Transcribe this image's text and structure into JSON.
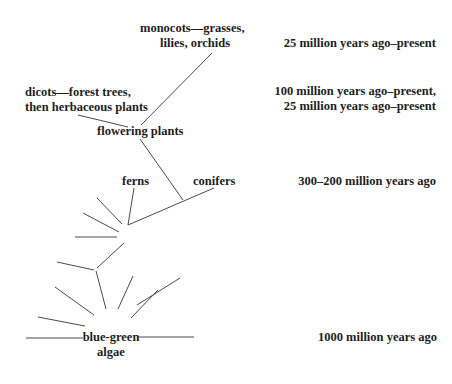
{
  "diagram": {
    "nodes": {
      "monocots": [
        "monocots—grasses,",
        "lilies, orchids"
      ],
      "dicots": [
        "dicots—forest trees,",
        "then herbaceous plants"
      ],
      "flowering": "flowering plants",
      "ferns": "ferns",
      "conifers": "conifers",
      "algae": [
        "blue-green",
        "algae"
      ]
    },
    "timeline": {
      "monocots": "25 million years ago–present",
      "dicots": [
        "100 million years ago–present,",
        "25 million years ago–present"
      ],
      "ferns_conifers": "300–200 million years ago",
      "algae": "1000 million years ago"
    },
    "line_color": "#4a4a4a"
  }
}
